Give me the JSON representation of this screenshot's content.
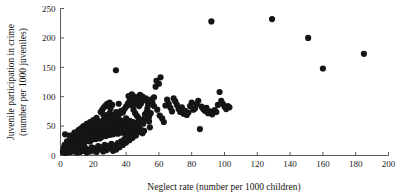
{
  "chart_data": {
    "type": "scatter",
    "title": "",
    "xlabel": "Neglect rate (number per 1000 children)",
    "ylabel_line1": "Juvenile participation in crime",
    "ylabel_line2": "(number per 1000 juveniles)",
    "xlim": [
      0,
      200
    ],
    "ylim": [
      0,
      250
    ],
    "xticks": [
      0,
      20,
      40,
      60,
      80,
      100,
      120,
      140,
      160,
      180,
      200
    ],
    "yticks": [
      0,
      50,
      100,
      150,
      200,
      250
    ],
    "xtick_labels": [
      "0",
      "20",
      "40",
      "60",
      "80",
      "100",
      "120",
      "140",
      "160",
      "180",
      "200"
    ],
    "ytick_labels": [
      "0",
      "50",
      "100",
      "150",
      "200",
      "250"
    ],
    "grid": false,
    "legend": "none",
    "marker": "filled-circle",
    "marker_color": "#151515",
    "marker_size": 3.1,
    "n_points": 352,
    "points": [
      [
        1.5,
        6
      ],
      [
        2,
        8
      ],
      [
        2.3,
        11
      ],
      [
        2.6,
        5
      ],
      [
        3,
        9
      ],
      [
        3.2,
        14
      ],
      [
        3.5,
        7
      ],
      [
        3.8,
        12
      ],
      [
        4,
        18
      ],
      [
        4.2,
        10
      ],
      [
        4.5,
        16
      ],
      [
        4.8,
        8
      ],
      [
        5,
        13
      ],
      [
        5.2,
        21
      ],
      [
        5.5,
        11
      ],
      [
        5.8,
        17
      ],
      [
        6,
        9
      ],
      [
        6.2,
        24
      ],
      [
        6.5,
        14
      ],
      [
        6.8,
        19
      ],
      [
        7,
        12
      ],
      [
        7.2,
        27
      ],
      [
        7.5,
        16
      ],
      [
        7.8,
        10
      ],
      [
        8,
        22
      ],
      [
        8.2,
        30
      ],
      [
        8.5,
        15
      ],
      [
        8.8,
        19
      ],
      [
        9,
        25
      ],
      [
        9.2,
        13
      ],
      [
        9.5,
        28
      ],
      [
        9.8,
        20
      ],
      [
        10,
        16
      ],
      [
        10.3,
        33
      ],
      [
        10.5,
        23
      ],
      [
        10.8,
        18
      ],
      [
        11,
        27
      ],
      [
        11.3,
        31
      ],
      [
        11.5,
        21
      ],
      [
        11.8,
        25
      ],
      [
        12,
        35
      ],
      [
        12.3,
        19
      ],
      [
        12.5,
        29
      ],
      [
        12.8,
        24
      ],
      [
        13,
        38
      ],
      [
        13.3,
        22
      ],
      [
        13.5,
        32
      ],
      [
        13.8,
        27
      ],
      [
        14,
        41
      ],
      [
        14.3,
        25
      ],
      [
        14.5,
        34
      ],
      [
        14.8,
        30
      ],
      [
        15,
        23
      ],
      [
        15.3,
        44
      ],
      [
        15.5,
        28
      ],
      [
        15.8,
        36
      ],
      [
        16,
        31
      ],
      [
        16.3,
        26
      ],
      [
        16.5,
        47
      ],
      [
        16.8,
        33
      ],
      [
        17,
        38
      ],
      [
        17.3,
        29
      ],
      [
        17.5,
        42
      ],
      [
        17.8,
        35
      ],
      [
        18,
        24
      ],
      [
        18.3,
        50
      ],
      [
        18.5,
        31
      ],
      [
        18.8,
        40
      ],
      [
        19,
        36
      ],
      [
        19.3,
        27
      ],
      [
        19.5,
        45
      ],
      [
        19.8,
        33
      ],
      [
        20,
        52
      ],
      [
        20.3,
        38
      ],
      [
        20.5,
        30
      ],
      [
        20.8,
        43
      ],
      [
        21,
        35
      ],
      [
        21.3,
        48
      ],
      [
        21.5,
        28
      ],
      [
        21.8,
        41
      ],
      [
        22,
        55
      ],
      [
        22.3,
        34
      ],
      [
        22.5,
        39
      ],
      [
        22.8,
        46
      ],
      [
        23,
        31
      ],
      [
        23.3,
        50
      ],
      [
        23.5,
        37
      ],
      [
        23.8,
        43
      ],
      [
        24,
        29
      ],
      [
        24.3,
        57
      ],
      [
        24.5,
        40
      ],
      [
        24.8,
        35
      ],
      [
        25,
        48
      ],
      [
        25.3,
        44
      ],
      [
        25.5,
        32
      ],
      [
        25.8,
        53
      ],
      [
        26,
        38
      ],
      [
        26.3,
        46
      ],
      [
        26.5,
        41
      ],
      [
        26.8,
        36
      ],
      [
        27,
        58
      ],
      [
        27.3,
        43
      ],
      [
        27.5,
        50
      ],
      [
        27.8,
        33
      ],
      [
        28,
        47
      ],
      [
        28.3,
        40
      ],
      [
        28.5,
        55
      ],
      [
        28.8,
        37
      ],
      [
        29,
        44
      ],
      [
        29.3,
        61
      ],
      [
        29.5,
        42
      ],
      [
        29.8,
        49
      ],
      [
        30,
        35
      ],
      [
        30.3,
        53
      ],
      [
        30.5,
        46
      ],
      [
        30.8,
        39
      ],
      [
        31,
        57
      ],
      [
        31.3,
        44
      ],
      [
        31.5,
        50
      ],
      [
        31.8,
        41
      ],
      [
        32,
        36
      ],
      [
        32.3,
        59
      ],
      [
        32.5,
        47
      ],
      [
        32.8,
        43
      ],
      [
        33,
        54
      ],
      [
        33.3,
        38
      ],
      [
        33.5,
        48
      ],
      [
        33.8,
        45
      ],
      [
        34,
        62
      ],
      [
        34.3,
        41
      ],
      [
        34.5,
        52
      ],
      [
        34.8,
        46
      ],
      [
        35,
        37
      ],
      [
        35.3,
        56
      ],
      [
        35.5,
        44
      ],
      [
        35.8,
        49
      ],
      [
        36,
        42
      ],
      [
        36.3,
        60
      ],
      [
        36.5,
        47
      ],
      [
        36.8,
        39
      ],
      [
        37,
        53
      ],
      [
        37.3,
        45
      ],
      [
        37.5,
        50
      ],
      [
        37.8,
        43
      ],
      [
        38,
        58
      ],
      [
        38.3,
        41
      ],
      [
        38.5,
        48
      ],
      [
        38.8,
        55
      ],
      [
        39,
        44
      ],
      [
        39.3,
        37
      ],
      [
        39.5,
        52
      ],
      [
        39.8,
        46
      ],
      [
        40,
        63
      ],
      [
        40.3,
        42
      ],
      [
        40.5,
        49
      ],
      [
        40.8,
        45
      ],
      [
        41,
        56
      ],
      [
        41.3,
        40
      ],
      [
        41.5,
        51
      ],
      [
        41.8,
        47
      ],
      [
        42,
        44
      ],
      [
        42.3,
        59
      ],
      [
        42.5,
        43
      ],
      [
        42.8,
        50
      ],
      [
        43,
        46
      ],
      [
        43.3,
        38
      ],
      [
        43.5,
        54
      ],
      [
        43.8,
        48
      ],
      [
        44,
        42
      ],
      [
        44.3,
        57
      ],
      [
        44.5,
        45
      ],
      [
        44.8,
        51
      ],
      [
        45,
        40
      ],
      [
        45.3,
        47
      ],
      [
        45.5,
        53
      ],
      [
        45.8,
        44
      ],
      [
        46,
        49
      ],
      [
        46.3,
        41
      ],
      [
        46.5,
        55
      ],
      [
        46.8,
        46
      ],
      [
        47,
        43
      ],
      [
        47.3,
        50
      ],
      [
        47.5,
        48
      ],
      [
        2.8,
        36
      ],
      [
        5.5,
        34
      ],
      [
        8.5,
        39
      ],
      [
        11,
        43
      ],
      [
        13,
        47
      ],
      [
        15,
        46
      ],
      [
        17,
        51
      ],
      [
        19,
        49
      ],
      [
        21,
        54
      ],
      [
        23,
        58
      ],
      [
        24,
        55
      ],
      [
        26,
        60
      ],
      [
        27,
        63
      ],
      [
        28,
        66
      ],
      [
        29,
        69
      ],
      [
        30,
        72
      ],
      [
        31,
        68
      ],
      [
        32,
        65
      ],
      [
        24.5,
        74
      ],
      [
        25.5,
        78
      ],
      [
        26.5,
        82
      ],
      [
        27.5,
        85
      ],
      [
        28.5,
        88
      ],
      [
        29.5,
        84
      ],
      [
        30.5,
        80
      ],
      [
        33,
        70
      ],
      [
        34,
        74
      ],
      [
        35,
        67
      ],
      [
        36,
        71
      ],
      [
        37,
        76
      ],
      [
        38,
        73
      ],
      [
        39,
        79
      ],
      [
        40,
        83
      ],
      [
        41,
        88
      ],
      [
        42,
        92
      ],
      [
        43,
        86
      ],
      [
        41.5,
        101
      ],
      [
        42.5,
        96
      ],
      [
        44,
        90
      ],
      [
        45,
        94
      ],
      [
        46,
        87
      ],
      [
        47,
        91
      ],
      [
        48,
        84
      ],
      [
        49,
        88
      ],
      [
        50,
        93
      ],
      [
        44.5,
        78
      ],
      [
        45.5,
        72
      ],
      [
        46.5,
        68
      ],
      [
        47.5,
        64
      ],
      [
        48.5,
        60
      ],
      [
        49.5,
        57
      ],
      [
        50.5,
        54
      ],
      [
        51,
        62
      ],
      [
        51.5,
        70
      ],
      [
        52,
        66
      ],
      [
        52.5,
        74
      ],
      [
        53,
        80
      ],
      [
        53.5,
        86
      ],
      [
        54,
        58
      ],
      [
        54.5,
        48
      ],
      [
        48,
        40
      ],
      [
        49,
        44
      ],
      [
        50,
        38
      ],
      [
        51,
        42
      ],
      [
        46,
        34
      ],
      [
        44,
        30
      ],
      [
        42,
        26
      ],
      [
        40,
        22
      ],
      [
        38,
        18
      ],
      [
        36,
        14
      ],
      [
        34,
        10
      ],
      [
        32,
        8
      ],
      [
        30,
        12
      ],
      [
        28,
        9
      ],
      [
        26,
        7
      ],
      [
        24,
        11
      ],
      [
        22,
        6
      ],
      [
        20,
        9
      ],
      [
        18,
        7
      ],
      [
        16,
        5
      ],
      [
        14,
        8
      ],
      [
        12,
        6
      ],
      [
        10,
        5
      ],
      [
        8,
        7
      ],
      [
        6,
        6
      ],
      [
        4,
        5
      ],
      [
        3,
        5
      ],
      [
        5,
        8
      ],
      [
        7,
        10
      ],
      [
        9,
        12
      ],
      [
        11,
        9
      ],
      [
        13,
        11
      ],
      [
        15,
        13
      ],
      [
        17,
        10
      ],
      [
        19,
        14
      ],
      [
        21,
        12
      ],
      [
        23,
        16
      ],
      [
        25,
        14
      ],
      [
        27,
        18
      ],
      [
        29,
        16
      ],
      [
        31,
        20
      ],
      [
        33,
        17
      ],
      [
        35,
        21
      ],
      [
        37,
        24
      ],
      [
        39,
        28
      ],
      [
        41,
        32
      ],
      [
        43,
        35
      ],
      [
        33.8,
        145
      ],
      [
        58,
        117
      ],
      [
        58.5,
        127
      ],
      [
        60,
        122
      ],
      [
        61,
        133
      ],
      [
        56,
        90
      ],
      [
        57,
        84
      ],
      [
        59,
        78
      ],
      [
        60.5,
        68
      ],
      [
        62,
        63
      ],
      [
        63,
        57
      ],
      [
        55,
        72
      ],
      [
        54,
        66
      ],
      [
        64,
        85
      ],
      [
        66,
        88
      ],
      [
        67,
        81
      ],
      [
        68,
        75
      ],
      [
        70,
        92
      ],
      [
        71,
        86
      ],
      [
        72,
        79
      ],
      [
        73,
        74
      ],
      [
        75,
        71
      ],
      [
        76,
        76
      ],
      [
        77,
        69
      ],
      [
        78,
        73
      ],
      [
        79,
        84
      ],
      [
        80,
        90
      ],
      [
        81,
        78
      ],
      [
        83,
        87
      ],
      [
        84,
        93
      ],
      [
        85,
        45
      ],
      [
        86,
        83
      ],
      [
        88,
        76
      ],
      [
        90,
        72
      ],
      [
        92,
        228
      ],
      [
        92.5,
        70
      ],
      [
        97,
        108
      ],
      [
        98,
        93
      ],
      [
        99,
        88
      ],
      [
        100,
        83
      ],
      [
        101,
        79
      ],
      [
        102,
        84
      ],
      [
        103,
        82
      ],
      [
        94,
        77
      ],
      [
        95,
        74
      ],
      [
        129,
        232
      ],
      [
        151,
        200
      ],
      [
        160,
        148
      ],
      [
        185,
        173
      ],
      [
        65,
        95
      ],
      [
        69,
        97
      ],
      [
        74,
        82
      ],
      [
        82,
        80
      ],
      [
        87,
        79
      ],
      [
        89,
        81
      ],
      [
        91,
        75
      ],
      [
        93,
        73
      ],
      [
        96,
        86
      ],
      [
        50,
        100
      ],
      [
        52,
        97
      ],
      [
        53,
        92
      ],
      [
        55,
        95
      ],
      [
        57,
        99
      ],
      [
        47,
        99
      ],
      [
        48.5,
        103
      ],
      [
        43.5,
        104
      ],
      [
        45,
        100
      ],
      [
        35.5,
        88
      ],
      [
        31.5,
        86
      ],
      [
        30,
        90
      ],
      [
        26,
        70
      ],
      [
        22,
        64
      ],
      [
        20,
        60
      ],
      [
        18,
        57
      ],
      [
        16,
        54
      ],
      [
        14,
        50
      ],
      [
        12,
        45
      ],
      [
        10,
        40
      ],
      [
        8,
        35
      ],
      [
        6,
        30
      ],
      [
        4,
        24
      ],
      [
        2.5,
        18
      ],
      [
        2,
        13
      ],
      [
        1.8,
        9
      ]
    ]
  }
}
